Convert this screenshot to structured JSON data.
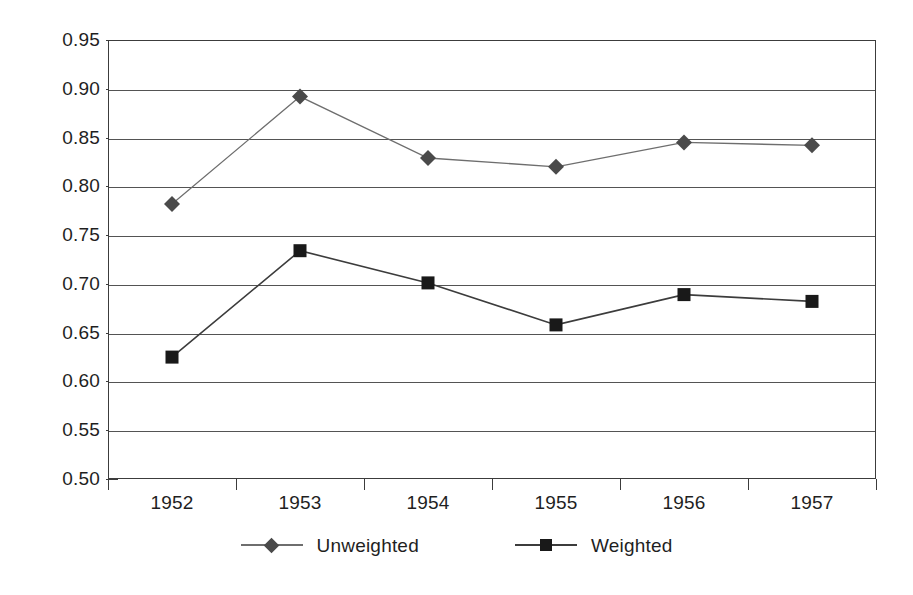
{
  "chart_data": {
    "type": "line",
    "title": "",
    "subtitle": "",
    "xlabel": "",
    "ylabel": "",
    "categories": [
      "1952",
      "1953",
      "1954",
      "1955",
      "1956",
      "1957"
    ],
    "ylim": [
      0.5,
      0.95
    ],
    "ytick_step": 0.05,
    "yticks": [
      "0.95",
      "0.90",
      "0.85",
      "0.80",
      "0.75",
      "0.70",
      "0.65",
      "0.60",
      "0.55",
      "0.50"
    ],
    "ytick_values": [
      0.95,
      0.9,
      0.85,
      0.8,
      0.75,
      0.7,
      0.65,
      0.6,
      0.55,
      0.5
    ],
    "grid": true,
    "grid_axis": "y",
    "legend_position": "bottom",
    "series": [
      {
        "name": "Unweighted",
        "marker": "diamond",
        "color": "#4a4a4a",
        "line_color": "#6e6e6e",
        "values": [
          0.782,
          0.892,
          0.829,
          0.82,
          0.845,
          0.842
        ]
      },
      {
        "name": "Weighted",
        "marker": "square",
        "color": "#191919",
        "line_color": "#3c3c3c",
        "values": [
          0.625,
          0.734,
          0.701,
          0.658,
          0.689,
          0.682
        ]
      }
    ]
  },
  "legend": {
    "entries": [
      {
        "label": "Unweighted",
        "marker": "diamond"
      },
      {
        "label": "Weighted",
        "marker": "square"
      }
    ]
  },
  "colors": {
    "frame": "#3c3c3c",
    "gridline": "#545454",
    "text": "#1f1f1f",
    "background": "#ffffff",
    "unweighted": "#4a4a4a",
    "weighted": "#191919"
  }
}
